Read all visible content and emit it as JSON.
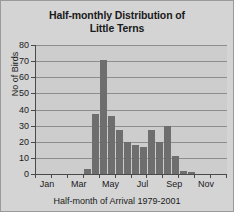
{
  "chart_data": {
    "type": "bar",
    "title": "Half-monthly Distribution of Little Terns",
    "title_line1": "Half-monthly Distribution of",
    "title_line2": "Little Terns",
    "xlabel": "Half-month of Arrival 1979-2001",
    "ylabel": "No of Birds",
    "ylim": [
      0,
      80
    ],
    "ytick_labels": [
      "80",
      "70",
      "60",
      "50",
      "40",
      "30",
      "20",
      "10",
      "0"
    ],
    "ytick_values": [
      80,
      70,
      60,
      50,
      40,
      30,
      20,
      10,
      0
    ],
    "grid": true,
    "legend": "none",
    "bar_color": "#6e6e6e",
    "plot_background": "#cdcdcd",
    "figure_background": "#d4d4d4",
    "axis_color": "#4a4a4a",
    "gridline_color": "#8d8d8d",
    "categories": [
      "Jan 1",
      "Jan 2",
      "Feb 1",
      "Feb 2",
      "Mar 1",
      "Mar 2",
      "Apr 1",
      "Apr 2",
      "May 1",
      "May 2",
      "Jun 1",
      "Jun 2",
      "Jul 1",
      "Jul 2",
      "Aug 1",
      "Aug 2",
      "Sep 1",
      "Sep 2",
      "Oct 1",
      "Oct 2",
      "Nov 1",
      "Nov 2",
      "Dec 1",
      "Dec 2"
    ],
    "values": [
      0,
      0,
      0,
      0,
      0,
      0,
      3,
      37,
      71,
      36,
      27,
      20,
      18,
      17,
      27,
      20,
      30,
      11,
      2,
      1,
      0,
      0,
      0,
      0
    ],
    "xtick_labels": [
      "Jan",
      "Mar",
      "May",
      "Jul",
      "Sep",
      "Nov"
    ],
    "xtick_label_positions": [
      1,
      5,
      9,
      13,
      17,
      21
    ]
  }
}
